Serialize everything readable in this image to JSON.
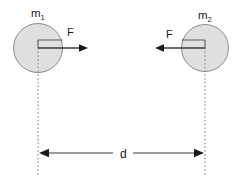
{
  "diagram": {
    "background_color": "#ffffff",
    "canvas": {
      "width": 243,
      "height": 182
    },
    "colors": {
      "body_fill": "#dfdfdf",
      "body_stroke": "#8c8c8c",
      "vector": "#1a1a1a",
      "dashed_guide": "#7a7a7a",
      "text": "#1a1a1a"
    },
    "bodies": [
      {
        "id": "mass-1",
        "label": "m",
        "subscript": "1",
        "cx": 38,
        "cy": 48,
        "r": 24.5,
        "label_x": 31,
        "label_y": 17
      },
      {
        "id": "mass-2",
        "label": "m",
        "subscript": "2",
        "cx": 205,
        "cy": 48,
        "r": 23.5,
        "label_x": 198,
        "label_y": 19
      }
    ],
    "force_vectors": [
      {
        "id": "force-on-mass-1",
        "label": "F",
        "direction": "right",
        "start_x": 38,
        "end_x": 88,
        "y": 48,
        "label_x": 67,
        "label_y": 36
      },
      {
        "id": "force-on-mass-2",
        "label": "F",
        "direction": "left",
        "start_x": 205,
        "end_x": 155,
        "y": 48,
        "label_x": 166,
        "label_y": 38
      }
    ],
    "center_guides": [
      {
        "id": "center-line-mass-1",
        "x": 38,
        "y_top": 48,
        "y_bottom": 176
      },
      {
        "id": "center-line-mass-2",
        "x": 205,
        "y_top": 48,
        "y_bottom": 176
      }
    ],
    "dimension": {
      "id": "separation-distance",
      "label": "d",
      "y": 153,
      "x_left": 39,
      "x_right": 204,
      "label_x": 121,
      "label_y": 158,
      "gap_left": 113,
      "gap_right": 133,
      "arrowheads": "both"
    }
  }
}
